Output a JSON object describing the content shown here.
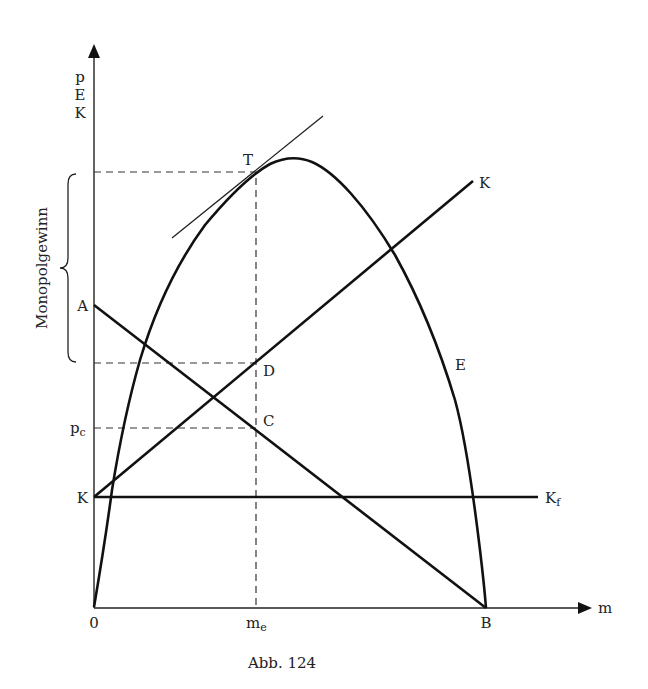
{
  "figure": {
    "caption": "Abb. 124",
    "y_axis_labels": [
      "p",
      "E",
      "K"
    ],
    "x_axis_label": "m",
    "bracket_label": "Monopolgewinn"
  },
  "points": {
    "origin": "0",
    "A": "A",
    "B": "B",
    "C": "C",
    "D": "D",
    "T": "T",
    "E": "E",
    "K_line": "K",
    "K_axis": "K",
    "Kf_main": "K",
    "Kf_sub": "f",
    "pc_main": "p",
    "pc_sub": "c",
    "me_main": "m",
    "me_sub": "e"
  },
  "curves": [
    {
      "name": "revenue-curve-E",
      "type": "parabola",
      "from": "0",
      "to": "B",
      "peak_label": "T"
    },
    {
      "name": "demand-line-AB",
      "type": "line",
      "from": "A",
      "to": "B"
    },
    {
      "name": "cost-line-K",
      "type": "line",
      "from": "K",
      "to": "K"
    },
    {
      "name": "fixed-cost-line-Kf",
      "type": "line",
      "horizontal_at": "K"
    },
    {
      "name": "tangent-at-T",
      "type": "line"
    }
  ]
}
